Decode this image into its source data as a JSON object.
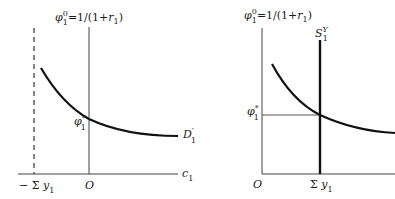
{
  "figure": {
    "left_panel": {
      "y_axis_label": {
        "base": "φ",
        "sup": "0",
        "sub": "1",
        "rest": "=1/(1+",
        "r": "r",
        "r_sub": "1",
        "close": ")"
      },
      "curve_label": {
        "base": "D",
        "prime": "′",
        "sub": "1"
      },
      "x_axis_label": {
        "base": "c",
        "sub": "1"
      },
      "equilibrium_label": {
        "base": "φ",
        "sup": "*",
        "sub": "1"
      },
      "origin_label": "O",
      "dashed_line_label": {
        "prefix": "− Σ ",
        "base": "y",
        "sub": "1"
      }
    },
    "right_panel": {
      "y_axis_label": {
        "base": "φ",
        "sup": "0",
        "sub": "1",
        "rest": "=1/(1+",
        "r": "r",
        "r_sub": "1",
        "close": ")"
      },
      "supply_label": {
        "base": "S",
        "sup": "Y",
        "sub": "1"
      },
      "equilibrium_label": {
        "base": "φ",
        "sup": "*",
        "sub": "1"
      },
      "origin_label": "O",
      "x_tick_label": {
        "prefix": "Σ ",
        "base": "y",
        "sub": "1"
      }
    },
    "colors": {
      "line": "#1a1a1a",
      "axis": "#333333",
      "background": "#ffffff"
    }
  }
}
